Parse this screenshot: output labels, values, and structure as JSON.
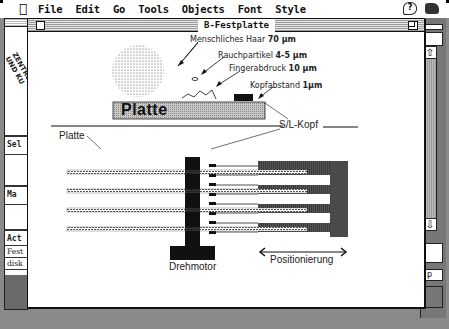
{
  "menubar": {
    "items": [
      "File",
      "Edit",
      "Go",
      "Tools",
      "Objects",
      "Font",
      "Style"
    ],
    "apple_icon": "apple-icon",
    "help_icon": "help-balloon-icon",
    "app_icon": "application-icon"
  },
  "window": {
    "title": "B-Festplatte"
  },
  "left_panel": {
    "logo_line1": "ZENTRUM F",
    "logo_line2": "UND KU",
    "labels": [
      "Sel",
      "Ma",
      "Act",
      "Fest",
      "disk"
    ]
  },
  "right_panel": {
    "button_label": "p"
  },
  "diagram": {
    "labels": {
      "hair": "Menschliches Haar",
      "hair_value": "70 µm",
      "smoke": "Rauchpartikel",
      "smoke_value": "4-5 µm",
      "fingerprint": "Fingerabdruck",
      "fingerprint_value": "10 µm",
      "head_gap": "Kopfabstand",
      "head_gap_value": "1µm",
      "platter_big": "Platte",
      "platter_small": "Platte",
      "rw_head": "S/L-Kopf",
      "motor": "Drehmotor",
      "positioning": "Positionierung"
    },
    "platter_count": 4
  }
}
